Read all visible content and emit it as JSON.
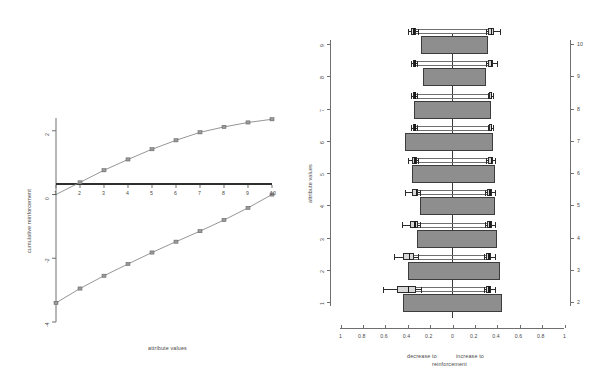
{
  "figure": {
    "background": "#ffffff",
    "bar_fill": "#8e8e8e",
    "box_fill": "#d8d8d8",
    "line_color": "#6f6f6f",
    "axis_color": "#6f6f6f"
  },
  "left_panel": {
    "xlabel": "attribute values",
    "ylabel": "cumulative reinforcement",
    "x_ticks": [
      "1",
      "2",
      "3",
      "4",
      "5",
      "6",
      "7",
      "8",
      "9",
      "10"
    ],
    "y_ticks": [
      "2",
      "0",
      "-2",
      "-4"
    ]
  },
  "right_panel": {
    "ylabel": "attribute values",
    "xlabel_left": "decrease to",
    "xlabel_right": "increase to",
    "xlabel_bottom": "reinforcement",
    "x_ticks": [
      "1",
      "0.8",
      "0.6",
      "0.4",
      "0.2",
      "0",
      "0.2",
      "0.4",
      "0.6",
      "0.8",
      "1"
    ],
    "y_ticks_left": [
      "1",
      "2",
      "3",
      "4",
      "5",
      "6",
      "7",
      "8",
      "9"
    ],
    "y_ticks_right": [
      "2",
      "3",
      "4",
      "5",
      "6",
      "7",
      "8",
      "9",
      "10"
    ]
  },
  "chart_data": [
    {
      "type": "line",
      "title": "",
      "xlabel": "attribute values",
      "ylabel": "cumulative reinforcement",
      "xlim": [
        1,
        10
      ],
      "ylim": [
        -4.0,
        2.4
      ],
      "grid": false,
      "legend": "none",
      "x": [
        1,
        2,
        3,
        4,
        5,
        6,
        7,
        8,
        9,
        10
      ],
      "series": [
        {
          "name": "increase to reinforcement",
          "values": [
            0.0,
            0.38,
            0.76,
            1.1,
            1.42,
            1.7,
            1.95,
            2.12,
            2.26,
            2.36
          ]
        },
        {
          "name": "decrease to reinforcement",
          "values": [
            -3.4,
            -2.95,
            -2.55,
            -2.18,
            -1.82,
            -1.48,
            -1.15,
            -0.8,
            -0.42,
            0.0
          ]
        }
      ]
    },
    {
      "type": "bar",
      "subtype": "tornado-with-boxplots",
      "xlabel": "decrease to / increase to reinforcement",
      "ylabel": "attribute values",
      "xlim": [
        -1,
        1
      ],
      "ylim": [
        0.5,
        9.5
      ],
      "grid": false,
      "legend": "none",
      "note": "negative values plotted left of zero as magnitude (decrease), positive right of zero (increase)",
      "categories": [
        "1",
        "2",
        "3",
        "4",
        "5",
        "6",
        "7",
        "8",
        "9"
      ],
      "series": [
        {
          "name": "decrease to reinforcement (bar left extent)",
          "values": [
            0.44,
            0.4,
            0.32,
            0.29,
            0.36,
            0.42,
            0.34,
            0.26,
            0.28
          ]
        },
        {
          "name": "increase to reinforcement (bar right extent)",
          "values": [
            0.44,
            0.42,
            0.4,
            0.38,
            0.38,
            0.36,
            0.34,
            0.3,
            0.32
          ]
        }
      ],
      "boxplots_left": [
        {
          "category": "1",
          "whisker_low": 0.62,
          "q1": 0.5,
          "median": 0.4,
          "q3": 0.33,
          "whisker_high": 0.28
        },
        {
          "category": "2",
          "whisker_low": 0.52,
          "q1": 0.44,
          "median": 0.39,
          "q3": 0.34,
          "whisker_high": 0.31
        },
        {
          "category": "3",
          "whisker_low": 0.45,
          "q1": 0.38,
          "median": 0.34,
          "q3": 0.31,
          "whisker_high": 0.29
        },
        {
          "category": "4",
          "whisker_low": 0.42,
          "q1": 0.36,
          "median": 0.33,
          "q3": 0.31,
          "whisker_high": 0.29
        },
        {
          "category": "5",
          "whisker_low": 0.4,
          "q1": 0.36,
          "median": 0.34,
          "q3": 0.32,
          "whisker_high": 0.31
        },
        {
          "category": "6",
          "whisker_low": 0.37,
          "q1": 0.35,
          "median": 0.34,
          "q3": 0.33,
          "whisker_high": 0.32
        },
        {
          "category": "7",
          "whisker_low": 0.37,
          "q1": 0.35,
          "median": 0.34,
          "q3": 0.33,
          "whisker_high": 0.32
        },
        {
          "category": "8",
          "whisker_low": 0.37,
          "q1": 0.35,
          "median": 0.34,
          "q3": 0.33,
          "whisker_high": 0.32
        },
        {
          "category": "9",
          "whisker_low": 0.4,
          "q1": 0.37,
          "median": 0.35,
          "q3": 0.33,
          "whisker_high": 0.31
        }
      ],
      "boxplots_right": [
        {
          "category": "1",
          "whisker_low": 0.28,
          "q1": 0.3,
          "median": 0.32,
          "q3": 0.34,
          "whisker_high": 0.38
        },
        {
          "category": "2",
          "whisker_low": 0.28,
          "q1": 0.3,
          "median": 0.32,
          "q3": 0.34,
          "whisker_high": 0.38
        },
        {
          "category": "3",
          "whisker_low": 0.29,
          "q1": 0.31,
          "median": 0.33,
          "q3": 0.35,
          "whisker_high": 0.38
        },
        {
          "category": "4",
          "whisker_low": 0.29,
          "q1": 0.31,
          "median": 0.33,
          "q3": 0.35,
          "whisker_high": 0.38
        },
        {
          "category": "5",
          "whisker_low": 0.3,
          "q1": 0.32,
          "median": 0.34,
          "q3": 0.36,
          "whisker_high": 0.38
        },
        {
          "category": "6",
          "whisker_low": 0.32,
          "q1": 0.33,
          "median": 0.34,
          "q3": 0.35,
          "whisker_high": 0.36
        },
        {
          "category": "7",
          "whisker_low": 0.32,
          "q1": 0.33,
          "median": 0.34,
          "q3": 0.35,
          "whisker_high": 0.36
        },
        {
          "category": "8",
          "whisker_low": 0.3,
          "q1": 0.32,
          "median": 0.34,
          "q3": 0.36,
          "whisker_high": 0.4
        },
        {
          "category": "9",
          "whisker_low": 0.3,
          "q1": 0.32,
          "median": 0.34,
          "q3": 0.37,
          "whisker_high": 0.42
        }
      ]
    }
  ]
}
